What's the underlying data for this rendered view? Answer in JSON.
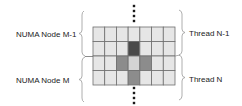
{
  "labels": {
    "numa_upper": "NUMA Node M-1",
    "numa_lower": "NUMA Node M",
    "thread_upper": "Thread N-1",
    "thread_lower": "Thread N"
  },
  "grid": {
    "rows": 4,
    "cols": 7,
    "cells": [
      [
        "light",
        "light",
        "light",
        "light",
        "light",
        "light",
        "light"
      ],
      [
        "light",
        "light",
        "light",
        "dark",
        "light",
        "light",
        "light"
      ],
      [
        "light",
        "light",
        "medium",
        "pale",
        "medium",
        "light",
        "light"
      ],
      [
        "light",
        "light",
        "light",
        "medium",
        "light",
        "light",
        "light"
      ]
    ]
  },
  "colors": {
    "light": "#e6e6e6",
    "pale": "#d4d4d4",
    "medium": "#8c8c8c",
    "dark": "#4a4a4a",
    "grid_line": "#6e6e6e",
    "brace": "#9a9a9a",
    "dots": "#1a1a1a"
  },
  "ellipsis": {
    "above_dots": 4,
    "below_dots": 4
  }
}
